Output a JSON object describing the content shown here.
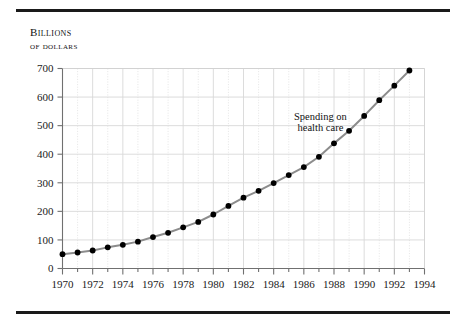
{
  "figure": {
    "top_rule": "horizontal-rule",
    "bottom_rule": "horizontal-rule",
    "axis_caption_line1": "Billions",
    "axis_caption_line2": "of dollars"
  },
  "chart_data": {
    "type": "line",
    "title": "",
    "subtitle": "",
    "xlabel": "",
    "ylabel": "Billions of dollars",
    "xlim": [
      1970,
      1994
    ],
    "ylim": [
      0,
      700
    ],
    "ytick_step": 100,
    "xtick_step": 1,
    "xtick_label_step": 2,
    "grid": true,
    "grid_major_color": "#d8d8d8",
    "grid_minor_color": "#dedede",
    "legend": "none",
    "line_color": "#8c8c8c",
    "marker_color": "#000000",
    "annotations": [
      {
        "text_line1": "Spending on",
        "text_line2": "health care",
        "x": 1987.1,
        "y": 520
      }
    ],
    "ytick_labels": [
      "0",
      "100",
      "200",
      "300",
      "400",
      "500",
      "600",
      "700"
    ],
    "ytick_values": [
      0,
      100,
      200,
      300,
      400,
      500,
      600,
      700
    ],
    "xtick_labels": [
      "1970",
      "1972",
      "1974",
      "1976",
      "1978",
      "1980",
      "1982",
      "1984",
      "1986",
      "1988",
      "1990",
      "1992",
      "1994"
    ],
    "xtick_values": [
      1970,
      1972,
      1974,
      1976,
      1978,
      1980,
      1982,
      1984,
      1986,
      1988,
      1990,
      1992,
      1994
    ],
    "series": [
      {
        "name": "Spending on health care",
        "x": [
          1970,
          1971,
          1972,
          1973,
          1974,
          1975,
          1976,
          1977,
          1978,
          1979,
          1980,
          1981,
          1982,
          1983,
          1984,
          1985,
          1986,
          1987,
          1988,
          1989,
          1990,
          1991,
          1992,
          1993
        ],
        "values": [
          50,
          56,
          63,
          74,
          83,
          94,
          110,
          125,
          144,
          163,
          189,
          219,
          248,
          272,
          299,
          327,
          355,
          391,
          438,
          482,
          534,
          589,
          640,
          693
        ]
      }
    ]
  }
}
